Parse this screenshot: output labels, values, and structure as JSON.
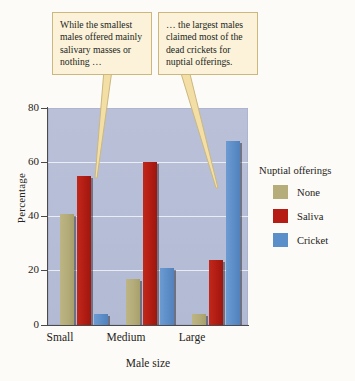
{
  "chart_data": {
    "type": "bar",
    "title": "",
    "xlabel": "Male size",
    "ylabel": "Percentage",
    "categories": [
      "Small",
      "Medium",
      "Large"
    ],
    "series": [
      {
        "name": "None",
        "color": "#b5ad7a",
        "values": [
          41,
          17,
          4
        ]
      },
      {
        "name": "Saliva",
        "color": "#b51d14",
        "values": [
          55,
          60,
          24
        ]
      },
      {
        "name": "Cricket",
        "color": "#5b8fc9",
        "values": [
          4,
          21,
          68
        ]
      }
    ],
    "ylim": [
      0,
      80
    ],
    "yticks": [
      0,
      20,
      40,
      60,
      80
    ],
    "grid": true,
    "legend_position": "right",
    "legend_title": "Nuptial offerings",
    "annotations": [
      "While the smallest males offered mainly salivary masses or nothing …",
      "… the largest males claimed most of the dead crickets for nuptial offerings."
    ]
  },
  "axes": {
    "y_title": "Percentage",
    "x_title": "Male size",
    "y_ticks": [
      "80",
      "60",
      "40",
      "20",
      "0"
    ],
    "x_labels": [
      "Small",
      "Medium",
      "Large"
    ]
  },
  "legend": {
    "title": "Nuptial offerings",
    "items": [
      {
        "label": "None",
        "color": "#b5ad7a"
      },
      {
        "label": "Saliva",
        "color": "#b51d14"
      },
      {
        "label": "Cricket",
        "color": "#5b8fc9"
      }
    ]
  },
  "callouts": {
    "left": "While the smallest males offered mainly salivary masses or nothing …",
    "right": "… the largest males claimed most of the dead crickets for nuptial offerings."
  },
  "colors": {
    "plot_background": "#b6bdd6",
    "callout_fill": "#fbf2d9",
    "callout_border": "#cbb87e",
    "axis": "#4a4a4a"
  }
}
